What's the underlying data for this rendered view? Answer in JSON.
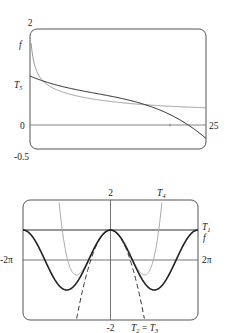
{
  "chart_data": [
    {
      "type": "line",
      "title": "",
      "xlabel": "",
      "ylabel": "",
      "xlim": [
        0,
        25
      ],
      "ylim": [
        -0.5,
        2
      ],
      "tick_labels": {
        "x_right": "25",
        "y_top": "2",
        "y_zero": "0",
        "y_bottom": "-0.5"
      },
      "series": [
        {
          "name": "f",
          "style": "solid-gray",
          "description": "decays steeply from near 2 at x≈0, levels to ≈0.33 by x=25"
        },
        {
          "name": "T5",
          "style": "solid-black",
          "description": "starts ≈1.0 at x=0, follows f through mid-range, dips below 0 near x≈23, ≈-0.3 at x=25"
        }
      ],
      "labels": {
        "f": "f",
        "T5": "T",
        "T5_sub": "5"
      }
    },
    {
      "type": "line",
      "title": "",
      "xlabel": "",
      "ylabel": "",
      "xlim": [
        -6.2832,
        6.2832
      ],
      "ylim": [
        -2,
        2
      ],
      "tick_labels": {
        "x_left": "-2π",
        "x_right": "2π",
        "y_top": "2",
        "y_bottom": "-2"
      },
      "series": [
        {
          "name": "f",
          "style": "solid-black-thick",
          "formula": "cos(x)"
        },
        {
          "name": "T1",
          "style": "solid-black",
          "formula": "1"
        },
        {
          "name": "T2 = T3",
          "style": "dashed-black",
          "formula": "1 - x^2/2"
        },
        {
          "name": "T4",
          "style": "solid-gray",
          "formula": "1 - x^2/2 + x^4/24"
        }
      ],
      "labels": {
        "T4": "T",
        "T4_sub": "4",
        "T1": "T",
        "T1_sub": "1",
        "f": "f",
        "T23_a": "T",
        "T23_a_sub": "2",
        "T23_eq": " = ",
        "T23_b": "T",
        "T23_b_sub": "3"
      }
    }
  ]
}
